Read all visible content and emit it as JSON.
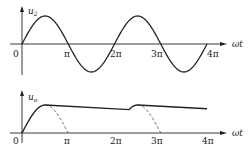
{
  "top_plot": {
    "y_label": "u",
    "y_label_sub": "2",
    "x_label": "ωt",
    "origin_label": "0",
    "ticks": [
      "π",
      "2π",
      "3π",
      "4π"
    ]
  },
  "bottom_plot": {
    "y_label": "u",
    "y_label_sub": "o",
    "x_label": "ωt",
    "origin_label": "0",
    "ticks": [
      "π",
      "2π",
      "3π",
      "4π"
    ]
  },
  "chart_data": [
    {
      "type": "line",
      "title": "",
      "xlabel": "ωt",
      "ylabel": "u2",
      "x_ticks": [
        "0",
        "π",
        "2π",
        "3π",
        "4π"
      ],
      "series": [
        {
          "name": "u2",
          "function": "sine",
          "periods": 2
        }
      ]
    },
    {
      "type": "line",
      "title": "",
      "xlabel": "ωt",
      "ylabel": "uo",
      "x_ticks": [
        "0",
        "π",
        "2π",
        "3π",
        "4π"
      ],
      "series": [
        {
          "name": "uo (capacitor-filtered output)",
          "style": "solid"
        },
        {
          "name": "half-wave rectified sine",
          "style": "dashed"
        }
      ]
    }
  ]
}
